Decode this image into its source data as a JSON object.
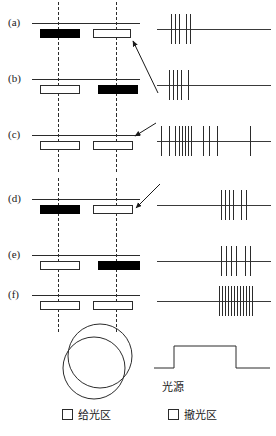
{
  "figure": {
    "rows": [
      {
        "label": "(a)",
        "bars": [
          {
            "fill": "filled",
            "x": 10,
            "width": 40,
            "zone": "撤光区"
          },
          {
            "fill": "open",
            "x": 63,
            "width": 38,
            "zone": "给光区"
          }
        ],
        "dashes": [
          28,
          86
        ],
        "spikes": [
          16,
          20,
          24,
          31,
          35
        ],
        "arrow": true
      },
      {
        "label": "(b)",
        "bars": [
          {
            "fill": "open",
            "x": 10,
            "width": 40,
            "zone": "给光区"
          },
          {
            "fill": "filled",
            "x": 68,
            "width": 40,
            "zone": "撤光区"
          }
        ],
        "dashes": [
          28,
          86
        ],
        "spikes": [
          14,
          18,
          22,
          26,
          33
        ],
        "arrow": true
      },
      {
        "label": "(c)",
        "bars": [
          {
            "fill": "open",
            "x": 10,
            "width": 40,
            "zone": "给光区"
          },
          {
            "fill": "open",
            "x": 63,
            "width": 40,
            "zone": "给光区"
          }
        ],
        "dashes": [
          28,
          86
        ],
        "spikes": [
          6,
          14,
          20,
          24,
          27,
          30,
          33,
          36,
          48,
          54,
          62,
          95
        ],
        "arrow": true
      },
      {
        "label": "(d)",
        "bars": [
          {
            "fill": "filled",
            "x": 10,
            "width": 40,
            "zone": "撤光区"
          },
          {
            "fill": "open",
            "x": 63,
            "width": 40,
            "zone": "给光区"
          }
        ],
        "dashes": [
          28,
          86
        ],
        "spikes": [
          66,
          70,
          74,
          78,
          86,
          91
        ],
        "arrow": true
      },
      {
        "label": "(e)",
        "bars": [
          {
            "fill": "open",
            "x": 10,
            "width": 40,
            "zone": "给光区"
          },
          {
            "fill": "filled",
            "x": 68,
            "width": 42,
            "zone": "撤光区"
          }
        ],
        "dashes": [
          28,
          86
        ],
        "spikes": [
          66,
          71,
          76,
          81,
          90,
          95
        ],
        "arrow": false
      },
      {
        "label": "(f)",
        "bars": [
          {
            "fill": "open",
            "x": 10,
            "width": 40,
            "zone": "给光区"
          },
          {
            "fill": "open",
            "x": 63,
            "width": 40,
            "zone": "给光区"
          }
        ],
        "dashes": [
          28,
          86
        ],
        "spikes": [
          64,
          67,
          70,
          73,
          76,
          79,
          82,
          85,
          88,
          91,
          94,
          97
        ],
        "arrow": false
      }
    ],
    "receptive_field": {
      "name": "receptive-field-circles",
      "circles": [
        {
          "cx": 50,
          "cy": 36,
          "r": 33
        },
        {
          "cx": 44,
          "cy": 47,
          "r": 32
        }
      ]
    },
    "light_source": {
      "label": "光源",
      "pulse": "step-on-off"
    },
    "legend": [
      {
        "swatch": "open-square",
        "label": "给光区"
      },
      {
        "swatch": "open-square",
        "label": "撤光区"
      }
    ]
  },
  "colors": {
    "ink": "#1a1a1a",
    "line": "#2b2b2b",
    "fill_black": "#000000",
    "fill_white": "#ffffff"
  }
}
